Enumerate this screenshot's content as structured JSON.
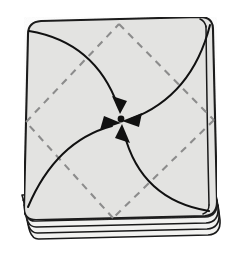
{
  "figure": {
    "background_color": "#ffffff",
    "paper_fill_color": "#e3e3e1",
    "paper_stroke_color": "#1a1a1a",
    "fold_line_color": "#8c8c8c",
    "arrow_color": "#111111",
    "center_dot_color": "#111111"
  },
  "paper": {
    "name": "folded-square-sheet",
    "corner_style": "rounded",
    "outline_path": "M 28 34 Q 28 22 41 21 L 200 17 Q 212 17 213 29 L 217 205 Q 217 217 205 218 L 36 222 Q 24 222 24 210 Z",
    "top_left_corner": [
      28,
      34
    ],
    "top_right_corner": [
      213,
      29
    ],
    "bottom_right_corner": [
      217,
      205
    ],
    "bottom_left_corner": [
      24,
      210
    ],
    "edge_midpoints": {
      "top": [
        119,
        26
      ],
      "right": [
        215,
        118
      ],
      "bottom": [
        113,
        218
      ],
      "left": [
        26,
        122
      ]
    }
  },
  "layers": {
    "name": "stacked-sheet-edges",
    "count": 4,
    "description": "multiple sheet layers visible along bottom edge",
    "paths": [
      "M 24 210 Q 24 222 36 222 L 205 218 Q 217 217 217 205",
      "M 25 215 Q 25 227 37 227 L 206 223 Q 218 222 218 210",
      "M 26 221 Q 26 233 38 233 L 207 229 Q 219 228 219 216",
      "M 27 227 Q 27 238 39 238 L 208 234 Q 220 233 220 222"
    ]
  },
  "fold_lines": {
    "name": "dashed-diamond-creases",
    "style": "dashed",
    "dash_pattern": "7 6",
    "segments": [
      {
        "name": "crease-top-to-right",
        "from": [
          119,
          26
        ],
        "to": [
          215,
          120
        ]
      },
      {
        "name": "crease-right-to-bottom",
        "from": [
          215,
          120
        ],
        "to": [
          113,
          218
        ]
      },
      {
        "name": "crease-bottom-to-left",
        "from": [
          113,
          218
        ],
        "to": [
          26,
          122
        ]
      },
      {
        "name": "crease-left-to-top",
        "from": [
          26,
          122
        ],
        "to": [
          119,
          26
        ]
      }
    ]
  },
  "arrows": [
    {
      "name": "arrow-from-top-left",
      "path": "M 29 31 Q 90 40 118 107",
      "tip": [
        120,
        112
      ],
      "direction_deg": 67,
      "start_corner": "top-left",
      "end": "center"
    },
    {
      "name": "arrow-from-top-right",
      "path": "M 211 26 Q 190 95 130 120",
      "tip": [
        123,
        122
      ],
      "direction_deg": 200,
      "start_corner": "top-right",
      "end": "center"
    },
    {
      "name": "arrow-from-bottom-right",
      "path": "M 210 212 Q 140 200 124 132",
      "tip": [
        122,
        126
      ],
      "direction_deg": 285,
      "start_corner": "bottom-right",
      "end": "center"
    },
    {
      "name": "arrow-from-bottom-left",
      "path": "M 28 208 Q 55 140 113 126",
      "tip": [
        119,
        125
      ],
      "direction_deg": 10,
      "start_corner": "bottom-left",
      "end": "center"
    }
  ],
  "center_point": {
    "name": "center-convergence-dot",
    "x": 121,
    "y": 119,
    "radius": 3.4
  }
}
